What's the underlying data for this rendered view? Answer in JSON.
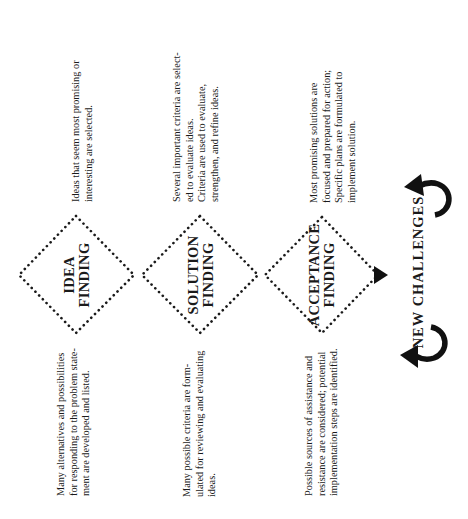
{
  "diagram": {
    "orientation": "rotated 90 degrees counter-clockwise",
    "stages": [
      {
        "id": "idea",
        "label_lines": [
          "IDEA",
          "FINDING"
        ],
        "divergent_text_lines": [
          "Many alternatives and possibilities",
          "for responding to the problem state-",
          "ment are developed and listed."
        ],
        "convergent_text_lines": [
          "Ideas that seem most promising or",
          "interesting are selected."
        ]
      },
      {
        "id": "solution",
        "label_lines": [
          "SOLUTION",
          "FINDING"
        ],
        "divergent_text_lines": [
          "Many possible criteria are form-",
          "ulated for reviewing and evaluating",
          "ideas."
        ],
        "convergent_text_lines": [
          "Several important criteria are select-",
          "ed to evaluate ideas.",
          "Criteria are used to evaluate,",
          "strengthen, and refine ideas."
        ]
      },
      {
        "id": "acceptance",
        "label_lines": [
          "ACCEPTANCE",
          "FINDING"
        ],
        "divergent_text_lines": [
          "Possible sources of assistance and",
          "resistance are considered; potential",
          "implementation steps are identified."
        ],
        "convergent_text_lines": [
          "Most promising solutions are",
          "focused and prepared for action;",
          "Specific plans are formulated to",
          "implement solution."
        ]
      }
    ],
    "loop_label": "NEW CHALLENGES",
    "icons": {
      "stage_shape": "dotted-diamond",
      "flow_arrow": "triangle-arrowhead",
      "loop_arrows": "curved-arrow"
    },
    "colors": {
      "ink": "#1a1a1a",
      "background": "#ffffff"
    }
  }
}
